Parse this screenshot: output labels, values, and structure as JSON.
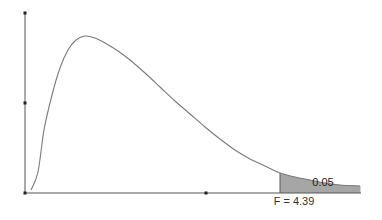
{
  "chart_data": {
    "type": "area",
    "title": "",
    "subtitle": "F distribution probability density with shaded upper tail",
    "xlabel": "",
    "ylabel": "",
    "grid": false,
    "legend": null,
    "annotations": {
      "tail_area_label": "0.05",
      "critical_value_label": "F = 4.39"
    },
    "critical_value": 4.39,
    "tail_probability": 0.05,
    "axis_markers": {
      "y_axis_dots": 3,
      "x_axis_dots": 2
    },
    "curve_points_px": [
      [
        31,
        190
      ],
      [
        38,
        172
      ],
      [
        44,
        130
      ],
      [
        52,
        95
      ],
      [
        60,
        68
      ],
      [
        68,
        50
      ],
      [
        76,
        40
      ],
      [
        85,
        36
      ],
      [
        95,
        38
      ],
      [
        105,
        43
      ],
      [
        118,
        51
      ],
      [
        130,
        60
      ],
      [
        145,
        73
      ],
      [
        160,
        87
      ],
      [
        175,
        101
      ],
      [
        190,
        114
      ],
      [
        205,
        127
      ],
      [
        220,
        139
      ],
      [
        235,
        150
      ],
      [
        250,
        159
      ],
      [
        265,
        166
      ],
      [
        280,
        173
      ],
      [
        295,
        177
      ],
      [
        310,
        180
      ],
      [
        325,
        183
      ],
      [
        340,
        185
      ],
      [
        360,
        186
      ]
    ],
    "shaded_region_px": {
      "x_start": 280,
      "x_end": 360
    },
    "colors": {
      "curve": "#7a7a7a",
      "axis": "#555555",
      "shade_fill": "#a6a6a6",
      "shade_stroke": "#5a5a5a",
      "dots": "#222222"
    }
  }
}
